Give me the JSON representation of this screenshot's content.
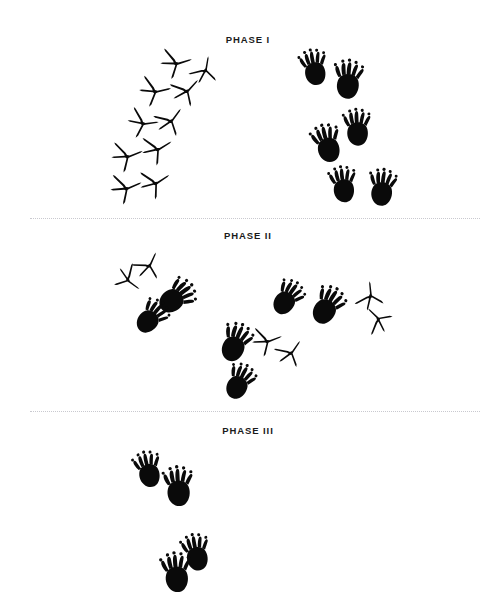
{
  "figure": {
    "width": 496,
    "height": 607,
    "background_color": "#ffffff",
    "ink_color": "#0a0a0a",
    "divider_color": "#c9c9cf",
    "caption_color": "#1b1b1b"
  },
  "phases": [
    {
      "id": "phase-1",
      "label": "PHASE I",
      "label_x": 248,
      "label_y": 41,
      "bird_track_count": 9,
      "mammal_track_count": 6
    },
    {
      "id": "phase-2",
      "label": "PHASE II",
      "label_x": 248,
      "label_y": 237,
      "bird_track_count": 6,
      "mammal_track_count": 6
    },
    {
      "id": "phase-3",
      "label": "PHASE III",
      "label_x": 248,
      "label_y": 432,
      "bird_track_count": 0,
      "mammal_track_count": 4
    }
  ],
  "dividers": [
    {
      "id": "divider-1",
      "y": 218,
      "x1": 30,
      "x2": 480
    },
    {
      "id": "divider-2",
      "y": 411,
      "x1": 30,
      "x2": 480
    }
  ],
  "tracks": {
    "bird": [
      {
        "phase": "phase-1",
        "x": 176,
        "y": 62,
        "rot": 8,
        "scale": 1.0
      },
      {
        "phase": "phase-1",
        "x": 204,
        "y": 70,
        "rot": -55,
        "scale": 0.9
      },
      {
        "phase": "phase-1",
        "x": 155,
        "y": 90,
        "rot": 12,
        "scale": 1.0
      },
      {
        "phase": "phase-1",
        "x": 186,
        "y": 90,
        "rot": -22,
        "scale": 0.96
      },
      {
        "phase": "phase-1",
        "x": 143,
        "y": 122,
        "rot": 18,
        "scale": 0.98
      },
      {
        "phase": "phase-1",
        "x": 170,
        "y": 120,
        "rot": -28,
        "scale": 0.96
      },
      {
        "phase": "phase-1",
        "x": 127,
        "y": 155,
        "rot": 4,
        "scale": 1.0
      },
      {
        "phase": "phase-1",
        "x": 157,
        "y": 148,
        "rot": -6,
        "scale": 0.98
      },
      {
        "phase": "phase-1",
        "x": 126,
        "y": 187,
        "rot": 2,
        "scale": 1.0
      },
      {
        "phase": "phase-1",
        "x": 155,
        "y": 182,
        "rot": -8,
        "scale": 0.98
      },
      {
        "phase": "phase-2",
        "x": 148,
        "y": 265,
        "rot": -40,
        "scale": 0.92
      },
      {
        "phase": "phase-2",
        "x": 129,
        "y": 279,
        "rot": 62,
        "scale": 0.9
      },
      {
        "phase": "phase-2",
        "x": 369,
        "y": 296,
        "rot": -70,
        "scale": 0.92
      },
      {
        "phase": "phase-2",
        "x": 377,
        "y": 320,
        "rot": -110,
        "scale": 0.9
      },
      {
        "phase": "phase-2",
        "x": 267,
        "y": 340,
        "rot": 4,
        "scale": 0.95
      },
      {
        "phase": "phase-2",
        "x": 290,
        "y": 352,
        "rot": -30,
        "scale": 0.92
      }
    ],
    "mammal": [
      {
        "phase": "phase-1",
        "x": 314,
        "y": 68,
        "rot": -12,
        "scale": 1.0
      },
      {
        "phase": "phase-1",
        "x": 348,
        "y": 80,
        "rot": 4,
        "scale": 1.08
      },
      {
        "phase": "phase-1",
        "x": 357,
        "y": 128,
        "rot": -4,
        "scale": 1.02
      },
      {
        "phase": "phase-1",
        "x": 327,
        "y": 144,
        "rot": -16,
        "scale": 1.06
      },
      {
        "phase": "phase-1",
        "x": 343,
        "y": 185,
        "rot": -8,
        "scale": 1.0
      },
      {
        "phase": "phase-1",
        "x": 382,
        "y": 188,
        "rot": 6,
        "scale": 1.02
      },
      {
        "phase": "phase-2",
        "x": 176,
        "y": 297,
        "rot": 52,
        "scale": 1.08
      },
      {
        "phase": "phase-2",
        "x": 151,
        "y": 317,
        "rot": 40,
        "scale": 1.0
      },
      {
        "phase": "phase-2",
        "x": 287,
        "y": 298,
        "rot": 34,
        "scale": 1.0
      },
      {
        "phase": "phase-2",
        "x": 327,
        "y": 306,
        "rot": 30,
        "scale": 1.08
      },
      {
        "phase": "phase-2",
        "x": 235,
        "y": 343,
        "rot": 22,
        "scale": 1.08
      },
      {
        "phase": "phase-2",
        "x": 239,
        "y": 382,
        "rot": 26,
        "scale": 1.0
      },
      {
        "phase": "phase-3",
        "x": 148,
        "y": 470,
        "rot": -14,
        "scale": 1.0
      },
      {
        "phase": "phase-3",
        "x": 178,
        "y": 487,
        "rot": -4,
        "scale": 1.1
      },
      {
        "phase": "phase-3",
        "x": 196,
        "y": 553,
        "rot": -12,
        "scale": 1.02
      },
      {
        "phase": "phase-3",
        "x": 176,
        "y": 573,
        "rot": -6,
        "scale": 1.1
      }
    ]
  }
}
